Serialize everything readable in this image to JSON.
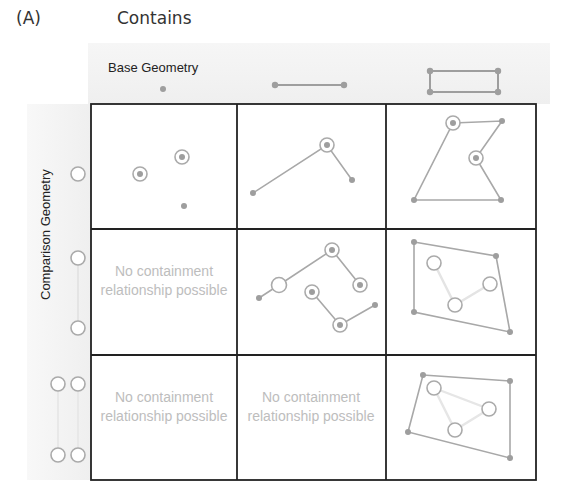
{
  "panel_label": "(A)",
  "title": "Contains",
  "column_header_label": "Base Geometry",
  "row_header_label": "Comparison Geometry",
  "columns": [
    {
      "name": "point",
      "icon": "point-icon"
    },
    {
      "name": "line",
      "icon": "line-icon"
    },
    {
      "name": "polygon",
      "icon": "polygon-icon"
    }
  ],
  "rows": [
    {
      "name": "point",
      "icon": "point-outline-icon"
    },
    {
      "name": "line",
      "icon": "line-outline-icon"
    },
    {
      "name": "polygon",
      "icon": "polygon-outline-icon"
    }
  ],
  "cells": {
    "r2c1": "No containment relationship possible",
    "r3c1": "No containment relationship possible",
    "r3c2": "No containment relationship possible"
  },
  "colors": {
    "geometry": "#9e9e9e",
    "grid": "#222222",
    "muted_text": "#bdbdbd",
    "header_band": "#f2f2f2"
  }
}
